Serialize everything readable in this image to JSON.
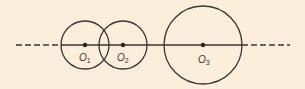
{
  "diagram": {
    "background": "#fbeedb",
    "stroke_color": "#3a3632",
    "axis_line": {
      "y": 45,
      "dashed_left": {
        "x1": 16,
        "x2": 61
      },
      "solid": {
        "x1": 61,
        "x2": 242
      },
      "dashed_right": {
        "x1": 242,
        "x2": 290
      }
    },
    "circles": [
      {
        "id": "O1",
        "cx": 85,
        "cy": 45,
        "r": 24,
        "label": "O",
        "subscript": "1"
      },
      {
        "id": "O2",
        "cx": 123,
        "cy": 45,
        "r": 24,
        "label": "O",
        "subscript": "2"
      },
      {
        "id": "O3",
        "cx": 203,
        "cy": 45,
        "r": 39,
        "label": "O",
        "subscript": "3"
      }
    ]
  }
}
